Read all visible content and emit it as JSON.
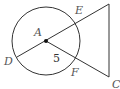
{
  "diagram": {
    "type": "geometry",
    "colors": {
      "stroke": "#333333",
      "label": "#555555",
      "background": "#ffffff"
    },
    "circle": {
      "center_label": "A",
      "cx": 46,
      "cy": 41,
      "r": 34
    },
    "points": {
      "A": {
        "label": "A",
        "x": 46,
        "y": 41
      },
      "D": {
        "label": "D",
        "x": 17,
        "y": 57
      },
      "E": {
        "label": "E",
        "x": 76,
        "y": 24
      },
      "F": {
        "label": "F",
        "x": 74,
        "y": 58
      },
      "C": {
        "label": "C",
        "x": 109,
        "y": 77
      },
      "top_vertex": {
        "label": "",
        "x": 109,
        "y": 4
      }
    },
    "labels": {
      "A": "A",
      "D": "D",
      "E": "E",
      "F": "F",
      "C": "C",
      "segment_AF_length": "5"
    }
  }
}
